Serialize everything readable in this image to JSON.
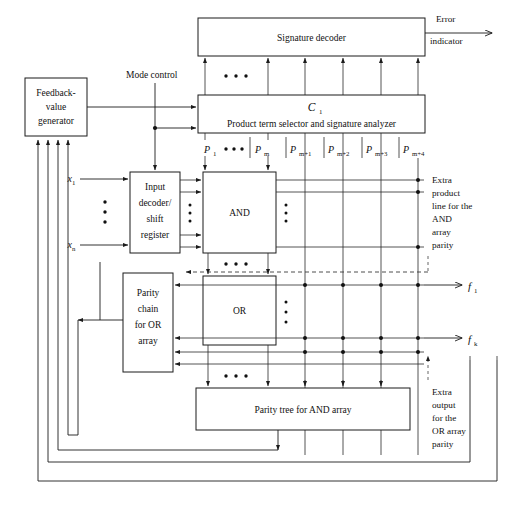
{
  "figure": {
    "type": "block-diagram",
    "background": "#ffffff",
    "line_color": "#1b1b1b"
  },
  "blocks": {
    "signature_decoder": {
      "label": "Signature decoder"
    },
    "control_block": {
      "title": "C",
      "title_sub": "1",
      "label": "Product term selector and signature analyzer"
    },
    "feedback_generator": {
      "line1": "Feedback-",
      "line2": "value",
      "line3": "generator"
    },
    "input_decoder": {
      "line1": "Input",
      "line2": "decoder/",
      "line3": "shift",
      "line4": "register"
    },
    "and_array": {
      "label": "AND"
    },
    "or_array": {
      "label": "OR"
    },
    "parity_chain": {
      "line1": "Parity",
      "line2": "chain",
      "line3": "for OR",
      "line4": "array"
    },
    "parity_tree": {
      "label": "Parity tree for AND array"
    }
  },
  "signals": {
    "mode_control": "Mode control",
    "error_indicator_line1": "Error",
    "error_indicator_line2": "indicator",
    "input_first": "x",
    "input_first_sub": "1",
    "input_last": "x",
    "input_last_sub": "n",
    "output_first": "f",
    "output_first_sub": "1",
    "output_last": "f",
    "output_last_sub": "k"
  },
  "product_lines": [
    {
      "name": "P",
      "sub": "1",
      "x": 205
    },
    {
      "name": "P",
      "sub": "m",
      "x": 268
    },
    {
      "name": "P",
      "sub": "m+1",
      "x": 305
    },
    {
      "name": "P",
      "sub": "m+2",
      "x": 343
    },
    {
      "name": "P",
      "sub": "m+3",
      "x": 381
    },
    {
      "name": "P",
      "sub": "m+4",
      "x": 418
    }
  ],
  "annotations": {
    "extra_product": [
      "Extra",
      "product",
      "line for the",
      "AND",
      "array",
      "parity"
    ],
    "extra_output": [
      "Extra",
      "output",
      "for the",
      "OR array",
      "parity"
    ]
  }
}
